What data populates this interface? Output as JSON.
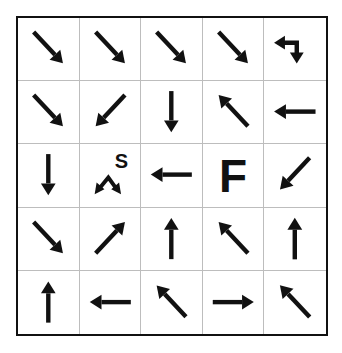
{
  "puzzle": {
    "rows": 5,
    "cols": 5,
    "colors": {
      "ink": "#111111",
      "grid_line": "#bdbdbd",
      "background": "#ffffff"
    },
    "cells": [
      [
        {
          "arrow": "down-right"
        },
        {
          "arrow": "down-right"
        },
        {
          "arrow": "down-right"
        },
        {
          "arrow": "down-right"
        },
        {
          "arrow": "left-then-down"
        }
      ],
      [
        {
          "arrow": "down-right"
        },
        {
          "arrow": "down-left"
        },
        {
          "arrow": "down"
        },
        {
          "arrow": "up-left"
        },
        {
          "arrow": "left"
        }
      ],
      [
        {
          "arrow": "down"
        },
        {
          "arrow": "down-left-and-down-right",
          "label": "S"
        },
        {
          "arrow": "left"
        },
        {
          "arrow": "none",
          "label": "F"
        },
        {
          "arrow": "down-left"
        }
      ],
      [
        {
          "arrow": "down-right"
        },
        {
          "arrow": "up-right"
        },
        {
          "arrow": "up"
        },
        {
          "arrow": "up-left"
        },
        {
          "arrow": "up"
        }
      ],
      [
        {
          "arrow": "up"
        },
        {
          "arrow": "left"
        },
        {
          "arrow": "up-left"
        },
        {
          "arrow": "right"
        },
        {
          "arrow": "up-left"
        }
      ]
    ],
    "start_label": "S",
    "finish_label": "F"
  }
}
